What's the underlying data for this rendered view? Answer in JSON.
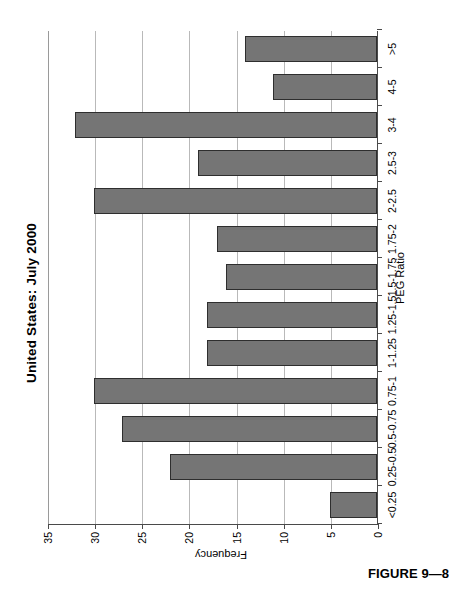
{
  "figure": {
    "caption": "FIGURE 9—8"
  },
  "chart_data": {
    "type": "bar",
    "title": "United States: July 2000",
    "xlabel": "PEG Ratio",
    "ylabel": "Frequency",
    "orientation": "vertical",
    "grid": true,
    "legend": null,
    "ylim": [
      0,
      35
    ],
    "yticks": [
      0,
      5,
      10,
      15,
      20,
      25,
      30,
      35
    ],
    "ytick_labels": [
      "0",
      "5",
      "10",
      "15",
      "20",
      "25",
      "30",
      "35"
    ],
    "categories": [
      "<0.25",
      "0.25-0.5",
      "0.5-0.75",
      "0.75-1",
      "1-1.25",
      "1.25-1.5",
      "1.5-1.75",
      "1.75-2",
      "2-2.5",
      "2.5-3",
      "3-4",
      "4-5",
      ">5"
    ],
    "values": [
      5,
      22,
      27,
      30,
      18,
      18,
      16,
      17,
      30,
      19,
      32,
      11,
      14
    ],
    "bar_color": "#757575",
    "bar_edge_color": "#2e2e2e"
  }
}
